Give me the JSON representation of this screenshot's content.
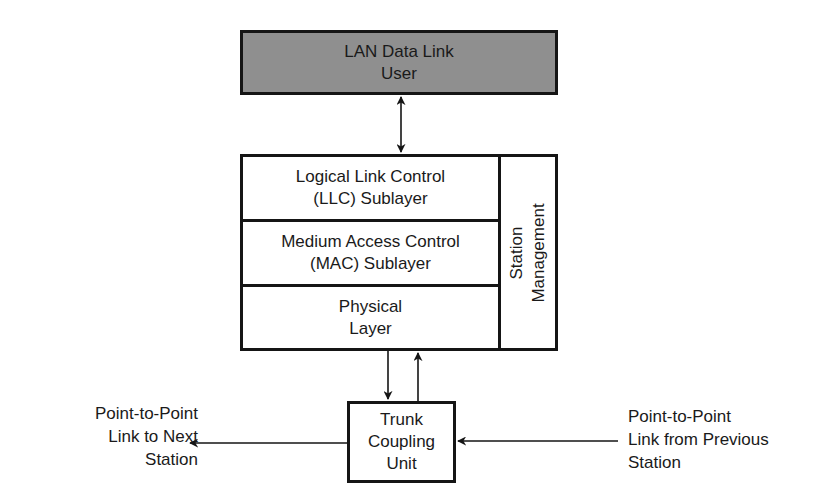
{
  "diagram": {
    "type": "block-diagram",
    "colors": {
      "user_box_fill": "#8f8f8f",
      "line": "#151515",
      "background": "#ffffff"
    },
    "user_box": {
      "line1": "LAN Data Link",
      "line2": "User"
    },
    "stack": {
      "llc": {
        "line1": "Logical Link Control",
        "line2": "(LLC) Sublayer"
      },
      "mac": {
        "line1": "Medium Access Control",
        "line2": "(MAC) Sublayer"
      },
      "physical": {
        "line1": "Physical",
        "line2": "Layer"
      },
      "management": {
        "line1": "Station",
        "line2": "Management"
      }
    },
    "trunk_coupling_unit": {
      "line1": "Trunk",
      "line2": "Coupling",
      "line3": "Unit"
    },
    "left_link": {
      "line1": "Point-to-Point",
      "line2": "Link to Next",
      "line3": "Station"
    },
    "right_link": {
      "line1": "Point-to-Point",
      "line2": "Link from Previous",
      "line3": "Station"
    },
    "connections": [
      {
        "from": "LAN Data Link User",
        "to": "LLC Sublayer",
        "direction": "bidirectional"
      },
      {
        "from": "Physical Layer",
        "to": "Trunk Coupling Unit",
        "direction": "down"
      },
      {
        "from": "Trunk Coupling Unit",
        "to": "Physical Layer",
        "direction": "up"
      },
      {
        "from": "Trunk Coupling Unit",
        "to": "Point-to-Point Link to Next Station",
        "direction": "left"
      },
      {
        "from": "Point-to-Point Link from Previous Station",
        "to": "Trunk Coupling Unit",
        "direction": "left"
      }
    ]
  }
}
